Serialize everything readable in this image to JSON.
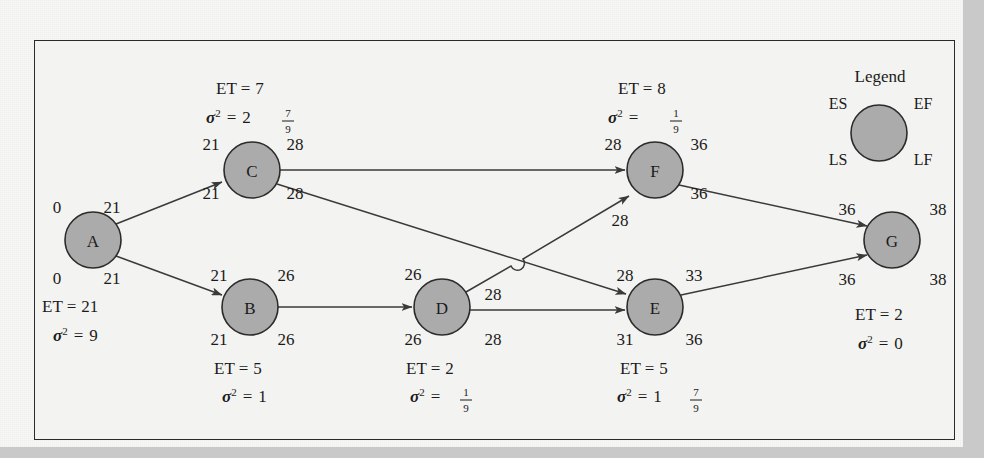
{
  "figure": {
    "type": "pert-cpm-network-diagram",
    "frame": {
      "border_color": "#2a2a2a",
      "background": "#f3f3f1"
    },
    "node_fill_color": "#ababab",
    "node_stroke_color": "#2b2b2b",
    "edge_color": "#3a3a3a"
  },
  "legend": {
    "title": "Legend",
    "es": "ES",
    "ef": "EF",
    "ls": "LS",
    "lf": "LF"
  },
  "labels": {
    "et_prefix": "ET =",
    "variance_symbol": "σ",
    "variance_exponent": "2",
    "equals": "="
  },
  "nodes": [
    {
      "id": "A",
      "label": "A",
      "cx": 93,
      "cy": 240,
      "r": 28,
      "es": "0",
      "ef": "21",
      "ls": "0",
      "lf": "21",
      "et": "21",
      "variance": "9",
      "variance_whole": "9",
      "variance_num": "",
      "variance_den": "",
      "stats_position": "below-left"
    },
    {
      "id": "B",
      "label": "B",
      "cx": 250,
      "cy": 307,
      "r": 28,
      "es": "21",
      "ef": "26",
      "ls": "21",
      "lf": "26",
      "et": "5",
      "variance": "1",
      "variance_whole": "1",
      "variance_num": "",
      "variance_den": "",
      "stats_position": "below"
    },
    {
      "id": "C",
      "label": "C",
      "cx": 252,
      "cy": 170,
      "r": 28,
      "es": "21",
      "ef": "28",
      "ls": "21",
      "lf": "28",
      "et": "7",
      "variance": "2 7/9",
      "variance_whole": "2",
      "variance_num": "7",
      "variance_den": "9",
      "stats_position": "above"
    },
    {
      "id": "D",
      "label": "D",
      "cx": 442,
      "cy": 307,
      "r": 28,
      "es": "26",
      "ef": "28",
      "ls": "26",
      "lf": "28",
      "et": "2",
      "variance": "1/9",
      "variance_whole": "",
      "variance_num": "1",
      "variance_den": "9",
      "stats_position": "below"
    },
    {
      "id": "E",
      "label": "E",
      "cx": 655,
      "cy": 307,
      "r": 28,
      "es": "28",
      "ef": "33",
      "ls": "31",
      "lf": "36",
      "et": "5",
      "variance": "1 7/9",
      "variance_whole": "1",
      "variance_num": "7",
      "variance_den": "9",
      "stats_position": "below"
    },
    {
      "id": "F",
      "label": "F",
      "cx": 655,
      "cy": 170,
      "r": 28,
      "es": "28",
      "ef": "36",
      "ls": "28",
      "lf": "36",
      "et": "8",
      "variance": "1/9",
      "variance_whole": "",
      "variance_num": "1",
      "variance_den": "9",
      "stats_position": "above"
    },
    {
      "id": "G",
      "label": "G",
      "cx": 892,
      "cy": 240,
      "r": 28,
      "es": "36",
      "ef": "38",
      "ls": "36",
      "lf": "38",
      "et": "2",
      "variance": "0",
      "variance_whole": "0",
      "variance_num": "",
      "variance_den": "",
      "stats_position": "below"
    }
  ],
  "edges": [
    {
      "from": "A",
      "to": "C",
      "crosses": false
    },
    {
      "from": "A",
      "to": "B",
      "crosses": false
    },
    {
      "from": "C",
      "to": "F",
      "crosses": false
    },
    {
      "from": "C",
      "to": "E",
      "crosses": false
    },
    {
      "from": "B",
      "to": "D",
      "crosses": false
    },
    {
      "from": "D",
      "to": "F",
      "crosses": true
    },
    {
      "from": "D",
      "to": "E",
      "crosses": false
    },
    {
      "from": "F",
      "to": "G",
      "crosses": false
    },
    {
      "from": "E",
      "to": "G",
      "crosses": false
    }
  ],
  "node_time_labels": {
    "A": {
      "es": "0",
      "ef": "21",
      "ls": "0",
      "lf": "21"
    },
    "B": {
      "es": "21",
      "ef": "26",
      "ls": "21",
      "lf": "26"
    },
    "C": {
      "es": "21",
      "ef": "28",
      "ls": "21",
      "lf": "28"
    },
    "D": {
      "es": "26",
      "ef": "28",
      "ls": "26",
      "lf": "28"
    },
    "E": {
      "es": "28",
      "ef": "33",
      "ls": "31",
      "lf": "36"
    },
    "F": {
      "es": "28",
      "ef": "36",
      "ls": "28",
      "lf": "36"
    },
    "G": {
      "es": "36",
      "ef": "38",
      "ls": "36",
      "lf": "38"
    }
  }
}
